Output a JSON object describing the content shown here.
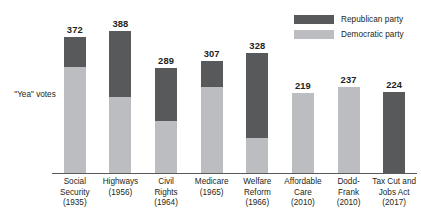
{
  "chart_data": {
    "type": "bar",
    "subtype": "stacked-bar",
    "title": "",
    "xlabel": "",
    "ylabel": "\"Yea\" votes",
    "ylim": [
      0,
      420
    ],
    "grid": false,
    "legend_position": "top-right",
    "categories": [
      "Social Security (1935)",
      "Highways (1956)",
      "Civil Rights (1964)",
      "Medicare (1965)",
      "Welfare Reform (1966)",
      "Affordable Care (2010)",
      "Dodd-Frank (2010)",
      "Tax Cut and Jobs Act (2017)"
    ],
    "series": [
      {
        "name": "Republican party",
        "color": "#58595b",
        "values": [
          81,
          179,
          144,
          70,
          230,
          0,
          0,
          224
        ]
      },
      {
        "name": "Democratic party",
        "color": "#bcbdc0",
        "values": [
          291,
          209,
          145,
          237,
          98,
          219,
          237,
          0
        ]
      }
    ],
    "totals": [
      372,
      388,
      289,
      307,
      328,
      219,
      237,
      224
    ]
  },
  "legend": {
    "items": [
      {
        "label": "Republican party",
        "color": "#58595b",
        "swatch_name": "republican-swatch"
      },
      {
        "label": "Democratic party",
        "color": "#bcbdc0",
        "swatch_name": "democratic-swatch"
      }
    ]
  },
  "axis": {
    "y_caption": "\"Yea\" votes"
  },
  "bars": [
    {
      "key": "social-security",
      "total": "372",
      "name_lines": [
        "Social",
        "Security",
        "(1935)"
      ]
    },
    {
      "key": "highways",
      "total": "388",
      "name_lines": [
        "Highways",
        "(1956)"
      ]
    },
    {
      "key": "civil-rights",
      "total": "289",
      "name_lines": [
        "Civil",
        "Rights",
        "(1964)"
      ]
    },
    {
      "key": "medicare",
      "total": "307",
      "name_lines": [
        "Medicare",
        "(1965)"
      ]
    },
    {
      "key": "welfare-reform",
      "total": "328",
      "name_lines": [
        "Welfare",
        "Reform",
        "(1966)"
      ]
    },
    {
      "key": "affordable-care",
      "total": "219",
      "name_lines": [
        "Affordable",
        "Care",
        "(2010)"
      ]
    },
    {
      "key": "dodd-frank",
      "total": "237",
      "name_lines": [
        "Dodd-",
        "Frank",
        "(2010)"
      ]
    },
    {
      "key": "tax-cut-jobs-act",
      "total": "224",
      "name_lines": [
        "Tax Cut and",
        "Jobs Act",
        "(2017)"
      ]
    }
  ]
}
